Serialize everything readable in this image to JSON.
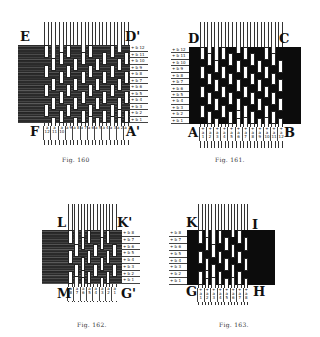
{
  "page": {
    "background": "#ffffff",
    "ink": "#111111"
  },
  "figures": [
    {
      "id": "fig160",
      "caption": "Fig. 160",
      "style": "hatched",
      "corners": {
        "top_left": "E",
        "top_right": "D'",
        "bottom_left": "F",
        "bottom_right": "A'"
      },
      "box": {
        "x": 18,
        "y": 18,
        "w": 122,
        "h": 110
      },
      "weave": {
        "x": 18,
        "y": 45,
        "w": 112,
        "h": 78
      },
      "warp_count": 12,
      "warp_start_x": 44,
      "warp_pitch": 7.3,
      "warp_width": 5,
      "warp_top": 22,
      "warp_bottom": 145,
      "row_labels_side": "right",
      "row_labels": [
        "+ b 12",
        "+ b 11",
        "+ b 10",
        "+ b 9",
        "+ b 8",
        "+ b 7",
        "+ b 6",
        "+ b 5",
        "+ b 4",
        "+ b 3",
        "+ b 2",
        "+ b 1"
      ],
      "col_labels": [
        "a 12",
        "a 11",
        "a 10",
        "a 9",
        "a 8",
        "a 7",
        "a 6",
        "a 5",
        "a 4",
        "a 3",
        "a 2",
        "a 1"
      ],
      "caption_pos": {
        "x": 62,
        "y": 156
      }
    },
    {
      "id": "fig161",
      "caption": "Fig. 161.",
      "style": "solid",
      "corners": {
        "top_left": "D",
        "top_right": "C",
        "bottom_left": "A",
        "bottom_right": "B"
      },
      "box": {
        "x": 168,
        "y": 18,
        "w": 135,
        "h": 112
      },
      "weave": {
        "x": 189,
        "y": 47,
        "w": 112,
        "h": 77
      },
      "warp_count": 12,
      "warp_start_x": 200,
      "warp_pitch": 7.1,
      "warp_width": 5,
      "warp_top": 22,
      "warp_bottom": 148,
      "row_labels_side": "left",
      "row_labels": [
        "+ b 12",
        "+ b 11",
        "+ b 10",
        "+ b 9",
        "+ b 8",
        "+ b 7",
        "+ b 6",
        "+ b 5",
        "+ b 4",
        "+ b 3",
        "+ b 2",
        "+ b 1"
      ],
      "col_labels": [
        "+ a 1",
        "+ a 2",
        "+ a 3",
        "+ a 4",
        "+ a 5",
        "+ a 6",
        "+ a 7",
        "+ a 8",
        "+ a 9",
        "+ a 10",
        "+ a 11",
        "+ a 12"
      ],
      "caption_pos": {
        "x": 215,
        "y": 156
      }
    },
    {
      "id": "fig162",
      "caption": "Fig. 162.",
      "style": "hatched",
      "corners": {
        "top_left": "L",
        "top_right": "K'",
        "bottom_left": "M",
        "bottom_right": "G'"
      },
      "box": {
        "x": 40,
        "y": 200,
        "w": 108,
        "h": 95
      },
      "weave": {
        "x": 42,
        "y": 230,
        "w": 80,
        "h": 54
      },
      "warp_count": 8,
      "warp_start_x": 68,
      "warp_pitch": 6.3,
      "warp_width": 4.5,
      "warp_top": 204,
      "warp_bottom": 302,
      "row_labels_side": "right",
      "row_labels": [
        "+ b 8",
        "+ b 7",
        "+ b 6",
        "+ b 5",
        "+ b 4",
        "+ b 3",
        "+ b 2",
        "+ b 1"
      ],
      "col_labels": [
        "a 8",
        "a 7",
        "a 6",
        "a 5",
        "a 4",
        "a 3",
        "a 2",
        "a 1"
      ],
      "caption_pos": {
        "x": 77,
        "y": 321
      }
    },
    {
      "id": "fig163",
      "caption": "Fig. 163.",
      "style": "solid",
      "corners": {
        "top_left": "K",
        "top_right": "I",
        "bottom_left": "G",
        "bottom_right": "H"
      },
      "box": {
        "x": 170,
        "y": 200,
        "w": 125,
        "h": 100
      },
      "weave": {
        "x": 187,
        "y": 230,
        "w": 88,
        "h": 55
      },
      "warp_count": 8,
      "warp_start_x": 198,
      "warp_pitch": 6.5,
      "warp_width": 4.5,
      "warp_top": 204,
      "warp_bottom": 305,
      "row_labels_side": "left",
      "row_labels": [
        "+ b 8",
        "+ b 7",
        "+ b 6",
        "+ b 5",
        "+ b 4",
        "+ b 3",
        "+ b 2",
        "+ b 1"
      ],
      "col_labels": [
        "+ a 1",
        "+ a 2",
        "+ a 3",
        "+ a 4",
        "+ a 5",
        "+ a 6",
        "+ a 7",
        "+ a 8"
      ],
      "caption_pos": {
        "x": 219,
        "y": 321
      }
    }
  ]
}
